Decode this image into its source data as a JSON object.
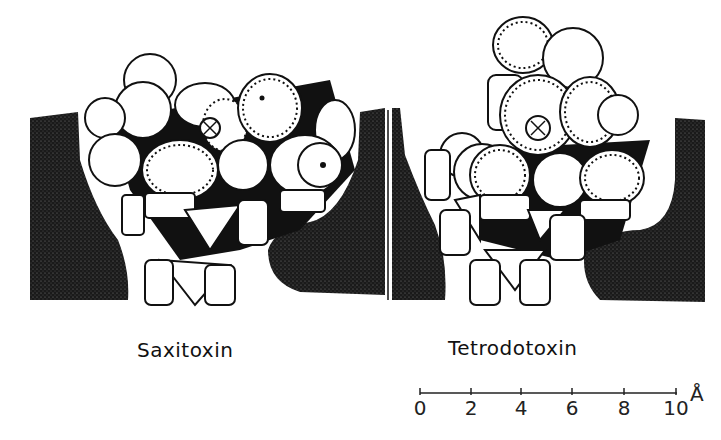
{
  "figure": {
    "panels": [
      {
        "id": "saxitoxin",
        "label": "Saxitoxin"
      },
      {
        "id": "tetrodotoxin",
        "label": "Tetrodotoxin"
      }
    ],
    "scale_bar": {
      "ticks": [
        "0",
        "2",
        "4",
        "6",
        "8",
        "10"
      ],
      "unit": "Å"
    },
    "colors": {
      "ink": "#111111",
      "background": "#ffffff",
      "stipple": "#1a1a1a"
    }
  }
}
